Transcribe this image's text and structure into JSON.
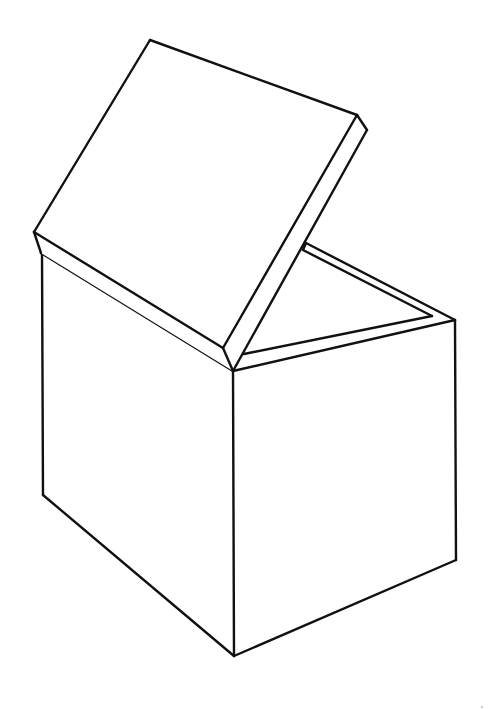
{
  "figure": {
    "stroke_color": "#111111",
    "background_color": "#ffffff",
    "width": 499,
    "height": 709
  },
  "box": {
    "vertices": {
      "front_top": [
        233,
        371
      ],
      "front_bottom": [
        234,
        656
      ],
      "left_top": [
        42,
        253
      ],
      "left_bottom": [
        43,
        495
      ],
      "right_top": [
        455,
        320
      ],
      "right_bottom": [
        456,
        560
      ]
    }
  },
  "lid": {
    "vertices": {
      "top": [
        150,
        40
      ],
      "left": [
        34,
        232
      ],
      "right": [
        357,
        115
      ],
      "right_thick": [
        367,
        130
      ],
      "bottom_hinge": [
        223,
        348
      ],
      "left_thick": [
        41,
        253
      ]
    }
  },
  "rim": {
    "back_outer_start": [
      306,
      243
    ],
    "back_inner_start": [
      303,
      250
    ],
    "right_outer": [
      455,
      320
    ],
    "right_inner": [
      432,
      316
    ],
    "front_inner_start": [
      244,
      354
    ]
  }
}
